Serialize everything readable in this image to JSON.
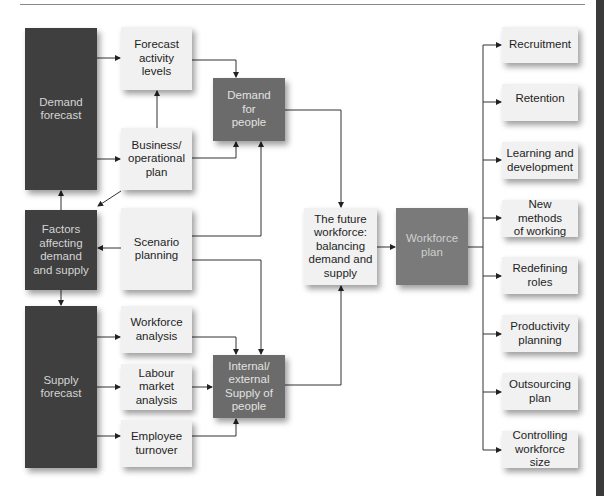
{
  "diagram": {
    "nodes": {
      "demand_forecast": "Demand\nforecast",
      "forecast_activity_levels": "Forecast\nactivity\nlevels",
      "business_operational_plan": "Business/\noperational\nplan",
      "demand_for_people": "Demand\nfor\npeople",
      "factors": "Factors\naffecting\ndemand\nand supply",
      "scenario_planning": "Scenario\nplanning",
      "supply_forecast": "Supply\nforecast",
      "workforce_analysis": "Workforce\nanalysis",
      "labour_market_analysis": "Labour\nmarket\nanalysis",
      "employee_turnover": "Employee\nturnover",
      "internal_external_supply": "Internal/\nexternal\nSupply of\npeople",
      "future_workforce": "The future\nworkforce:\nbalancing\ndemand and\nsupply",
      "workforce_plan": "Workforce\nplan"
    },
    "outcomes": [
      "Recruitment",
      "Retention",
      "Learning and\ndevelopment",
      "New methods\nof working",
      "Redefining\nroles",
      "Productivity\nplanning",
      "Outsourcing\nplan",
      "Controlling\nworkforce size"
    ],
    "colors": {
      "dark_box": "#3f3f3f",
      "mid_box": "#6b6b6b",
      "light_box": "#f1f1f1",
      "line": "#333333"
    }
  }
}
